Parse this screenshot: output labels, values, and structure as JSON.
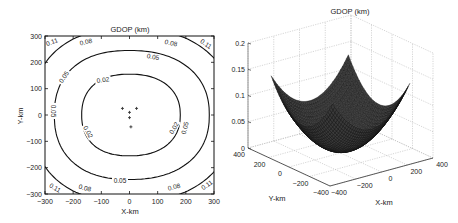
{
  "chart_data": [
    {
      "type": "contour",
      "title": "GDOP (km)",
      "xlabel": "X-km",
      "ylabel": "Y-km",
      "xlim": [
        -300,
        300
      ],
      "ylim": [
        -300,
        300
      ],
      "xticks": [
        -300,
        -200,
        -100,
        0,
        100,
        200,
        300
      ],
      "yticks": [
        -300,
        -200,
        -100,
        0,
        100,
        200,
        300
      ],
      "grid": false,
      "contour_levels": [
        {
          "level": 0.02,
          "label": "0.02",
          "half_width_x": 175,
          "center_y": 0,
          "half_height_y": 155
        },
        {
          "level": 0.05,
          "label": "0.05",
          "half_width_x": 275,
          "center_y": 0,
          "half_height_y": 245
        },
        {
          "level": 0.08,
          "label": "0.08",
          "half_width_x": 360,
          "center_y": 0,
          "half_height_y": 330
        },
        {
          "level": 0.11,
          "label": "0.11",
          "half_width_x": 430,
          "center_y": 0,
          "half_height_y": 400
        }
      ],
      "station_markers": [
        {
          "x": -25,
          "y": 25
        },
        {
          "x": 25,
          "y": 25
        },
        {
          "x": 0,
          "y": 10
        },
        {
          "x": 0,
          "y": -10
        },
        {
          "x": 5,
          "y": -45
        }
      ]
    },
    {
      "type": "surface3d",
      "title": "GDOP (km)",
      "xlabel": "X-km",
      "ylabel": "Y-km",
      "zlabel": "",
      "xlim": [
        -400,
        400
      ],
      "ylim": [
        -400,
        400
      ],
      "zlim": [
        0,
        0.2
      ],
      "xticks": [
        -400,
        -200,
        0,
        200,
        400
      ],
      "yticks": [
        -400,
        -200,
        0,
        200,
        400
      ],
      "zticks": [
        0,
        0.05,
        0.1,
        0.15,
        0.2
      ],
      "ztick_labels": [
        "0",
        "0.05",
        "0.1",
        "0.15",
        "0.2"
      ],
      "grid": true,
      "surface_extent_km": 300,
      "surface_min": 0.005,
      "surface_corner_max": 0.14
    }
  ],
  "labels": {
    "left_title": "GDOP (km)",
    "right_title": "GDOP (km)",
    "left_xlabel": "X-km",
    "left_ylabel": "Y-km",
    "right_xlabel": "X-km",
    "right_ylabel": "Y-km"
  }
}
